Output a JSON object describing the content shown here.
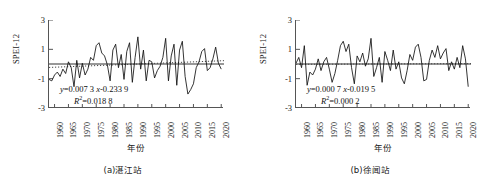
{
  "figure": {
    "panels": [
      {
        "id": "a",
        "caption": "(a)湛江站",
        "ylabel": "SPEI-12",
        "xlabel": "年份",
        "equation_line1": "y=0.007 3x-0.233 9",
        "equation_line2": "R2=0.018 8",
        "eq_y_coef": "0.007 3",
        "eq_intercept": "-0.233 9",
        "r_squared": "0.018 8"
      },
      {
        "id": "b",
        "caption": "(b)徐闻站",
        "ylabel": "SPEI-12",
        "xlabel": "年份",
        "equation_line1": "y=0.000 7x-0.019 5",
        "equation_line2": "R2=0.000 2",
        "eq_y_coef": "0.000 7",
        "eq_intercept": "-0.019 5",
        "r_squared": "0.000 2"
      }
    ]
  },
  "chart_data": [
    {
      "type": "line",
      "panel_id": "a",
      "title": "(a)湛江站",
      "xlabel": "年份",
      "ylabel": "SPEI-12",
      "xlim": [
        1958,
        2021
      ],
      "ylim": [
        -3,
        3
      ],
      "yticks": [
        -3,
        -1,
        1,
        3
      ],
      "xticks": [
        1960,
        1965,
        1970,
        1975,
        1980,
        1985,
        1990,
        1995,
        2000,
        2005,
        2010,
        2015,
        2020
      ],
      "grid": false,
      "legend": null,
      "annotations": [
        "y=0.007 3x-0.233 9",
        "R2=0.018 8"
      ],
      "trend": {
        "style": "dotted",
        "slope": 0.0073,
        "intercept": -0.2339,
        "r_squared": 0.0188
      },
      "zero_line": {
        "value": 0,
        "style": "solid"
      },
      "series": [
        {
          "name": "SPEI-12 湛江站",
          "x": [
            1958,
            1959,
            1960,
            1961,
            1962,
            1963,
            1964,
            1965,
            1966,
            1967,
            1968,
            1969,
            1970,
            1971,
            1972,
            1973,
            1974,
            1975,
            1976,
            1977,
            1978,
            1979,
            1980,
            1981,
            1982,
            1983,
            1984,
            1985,
            1986,
            1987,
            1988,
            1989,
            1990,
            1991,
            1992,
            1993,
            1994,
            1995,
            1996,
            1997,
            1998,
            1999,
            2000,
            2001,
            2002,
            2003,
            2004,
            2005,
            2006,
            2007,
            2008,
            2009,
            2010,
            2011,
            2012,
            2013,
            2014,
            2015,
            2016,
            2017,
            2018,
            2019,
            2020
          ],
          "values": [
            -1.05,
            -1.15,
            -0.75,
            -0.55,
            -0.85,
            -0.35,
            -0.65,
            0.15,
            -0.25,
            -1.55,
            0.25,
            -0.95,
            0.05,
            -0.75,
            -0.35,
            0.45,
            0.25,
            1.25,
            1.45,
            0.75,
            0.55,
            -0.05,
            -1.15,
            0.95,
            1.35,
            -0.25,
            0.65,
            -1.05,
            0.85,
            1.45,
            -1.25,
            0.45,
            1.85,
            -0.35,
            0.95,
            -1.15,
            0.25,
            0.15,
            -0.95,
            -0.45,
            -0.15,
            0.45,
            1.75,
            -1.15,
            0.55,
            1.35,
            -1.45,
            0.95,
            1.55,
            -0.85,
            -2.05,
            -1.75,
            -1.35,
            -0.25,
            0.15,
            0.85,
            1.05,
            -0.45,
            -0.25,
            0.35,
            1.15,
            0.05,
            -0.35
          ]
        }
      ]
    },
    {
      "type": "line",
      "panel_id": "b",
      "title": "(b)徐闻站",
      "xlabel": "年份",
      "ylabel": "SPEI-12",
      "xlim": [
        1958,
        2021
      ],
      "ylim": [
        -3,
        3
      ],
      "yticks": [
        -3,
        -1,
        1,
        3
      ],
      "xticks": [
        1960,
        1965,
        1970,
        1975,
        1980,
        1985,
        1990,
        1995,
        2000,
        2005,
        2010,
        2015,
        2020
      ],
      "grid": false,
      "legend": null,
      "annotations": [
        "y=0.000 7x-0.019 5",
        "R2=0.000 2"
      ],
      "trend": {
        "style": "dotted",
        "slope": 0.0007,
        "intercept": -0.0195,
        "r_squared": 0.0002
      },
      "zero_line": {
        "value": 0,
        "style": "solid"
      },
      "series": [
        {
          "name": "SPEI-12 徐闻站",
          "x": [
            1958,
            1959,
            1960,
            1961,
            1962,
            1963,
            1964,
            1965,
            1966,
            1967,
            1968,
            1969,
            1970,
            1971,
            1972,
            1973,
            1974,
            1975,
            1976,
            1977,
            1978,
            1979,
            1980,
            1981,
            1982,
            1983,
            1984,
            1985,
            1986,
            1987,
            1988,
            1989,
            1990,
            1991,
            1992,
            1993,
            1994,
            1995,
            1996,
            1997,
            1998,
            1999,
            2000,
            2001,
            2002,
            2003,
            2004,
            2005,
            2006,
            2007,
            2008,
            2009,
            2010,
            2011,
            2012,
            2013,
            2014,
            2015,
            2016,
            2017,
            2018,
            2019,
            2020
          ],
          "values": [
            0.05,
            0.45,
            -0.25,
            1.25,
            -1.45,
            -0.55,
            -0.75,
            -0.35,
            0.35,
            -0.45,
            0.15,
            0.45,
            -0.35,
            -1.25,
            -0.65,
            0.25,
            1.25,
            1.55,
            0.85,
            1.35,
            -0.25,
            -1.35,
            0.55,
            0.15,
            0.75,
            -0.15,
            0.35,
            1.75,
            -0.85,
            -0.25,
            0.45,
            -1.25,
            0.85,
            0.25,
            -0.45,
            0.95,
            -0.35,
            0.15,
            -0.95,
            -1.35,
            -0.45,
            0.65,
            0.25,
            1.15,
            1.35,
            0.45,
            -1.15,
            -1.05,
            0.25,
            0.95,
            0.45,
            1.25,
            0.35,
            0.75,
            1.05,
            -0.45,
            0.15,
            -0.35,
            0.45,
            -0.25,
            1.25,
            0.35,
            -1.55
          ]
        }
      ]
    }
  ]
}
